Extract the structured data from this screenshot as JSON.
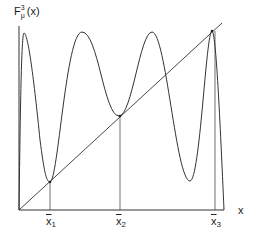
{
  "diagram": {
    "y_axis_label": {
      "base": "F",
      "superscript": "3",
      "subscript": "μ",
      "argument": "(x)"
    },
    "x_axis_label": "x",
    "fixed_points": [
      {
        "label": "x",
        "index": "1"
      },
      {
        "label": "x",
        "index": "2"
      },
      {
        "label": "x",
        "index": "3"
      }
    ],
    "colors": {
      "line": "#333333",
      "background": "#ffffff"
    }
  }
}
